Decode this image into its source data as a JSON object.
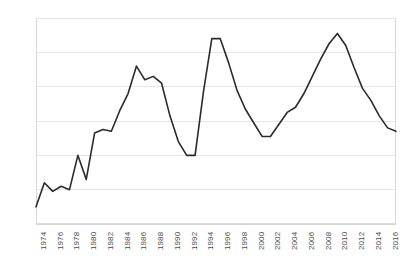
{
  "chart_data": {
    "type": "line",
    "title": "",
    "subtitle": "",
    "xlabel": "",
    "ylabel": "",
    "grid": true,
    "legend": false,
    "legend_position": "none",
    "line_color": "#2b2b2b",
    "gridline_color": "#e6e6e6",
    "axis_color": "#d9d9d9",
    "background": "#ffffff",
    "ylim": [
      0,
      12
    ],
    "ytick_values": [
      0,
      2,
      4,
      6,
      8,
      10,
      12
    ],
    "ytick_labels": [
      "0%",
      "2%",
      "4%",
      "6%",
      "8%",
      "10%",
      "12%"
    ],
    "xlim": [
      1974,
      2017
    ],
    "xtick_labels": [
      "1974",
      "1976",
      "1978",
      "1980",
      "1982",
      "1984",
      "1986",
      "1988",
      "1990",
      "1992",
      "1994",
      "1996",
      "1998",
      "2000",
      "2002",
      "2004",
      "2006",
      "2008",
      "2010",
      "2012",
      "2014",
      "2016"
    ],
    "x": [
      1974,
      1975,
      1976,
      1977,
      1978,
      1979,
      1980,
      1981,
      1982,
      1983,
      1984,
      1985,
      1986,
      1987,
      1988,
      1989,
      1990,
      1991,
      1992,
      1993,
      1994,
      1995,
      1996,
      1997,
      1998,
      1999,
      2000,
      2001,
      2002,
      2003,
      2004,
      2005,
      2006,
      2007,
      2008,
      2009,
      2010,
      2011,
      2012,
      2013,
      2014,
      2015,
      2016,
      2017
    ],
    "values": [
      1.0,
      2.4,
      1.9,
      2.2,
      2.0,
      4.0,
      2.6,
      5.3,
      5.5,
      5.4,
      6.6,
      7.6,
      9.2,
      8.4,
      8.6,
      8.2,
      6.3,
      4.8,
      4.0,
      4.0,
      7.7,
      10.8,
      10.8,
      9.4,
      7.8,
      6.7,
      5.9,
      5.1,
      5.1,
      5.8,
      6.5,
      6.8,
      7.6,
      8.6,
      9.6,
      10.5,
      11.1,
      10.4,
      9.1,
      7.9,
      7.2,
      6.3,
      5.6,
      5.4
    ],
    "series": [
      {
        "name": "series-1",
        "values": [
          1.0,
          2.4,
          1.9,
          2.2,
          2.0,
          4.0,
          2.6,
          5.3,
          5.5,
          5.4,
          6.6,
          7.6,
          9.2,
          8.4,
          8.6,
          8.2,
          6.3,
          4.8,
          4.0,
          4.0,
          7.7,
          10.8,
          10.8,
          9.4,
          7.8,
          6.7,
          5.9,
          5.1,
          5.1,
          5.8,
          6.5,
          6.8,
          7.6,
          8.6,
          9.6,
          10.5,
          11.1,
          10.4,
          9.1,
          7.9,
          7.2,
          6.3,
          5.6,
          5.4
        ]
      }
    ]
  }
}
